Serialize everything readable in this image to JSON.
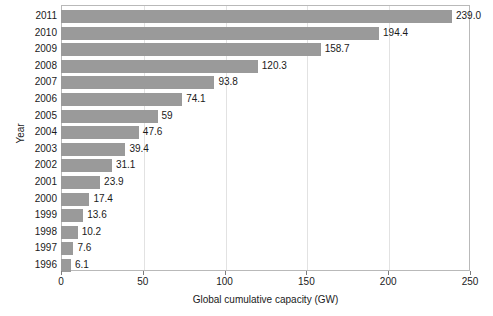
{
  "chart_data": {
    "type": "bar",
    "orientation": "horizontal",
    "title": "",
    "xlabel": "Global cumulative capacity (GW)",
    "ylabel": "Year",
    "categories": [
      "2011",
      "2010",
      "2009",
      "2008",
      "2007",
      "2006",
      "2005",
      "2004",
      "2003",
      "2002",
      "2001",
      "2000",
      "1999",
      "1998",
      "1997",
      "1996"
    ],
    "values": [
      239.0,
      194.4,
      158.7,
      120.3,
      93.8,
      74.1,
      59,
      47.6,
      39.4,
      31.1,
      23.9,
      17.4,
      13.6,
      10.2,
      7.6,
      6.1
    ],
    "data_labels": [
      "239.0",
      "194.4",
      "158.7",
      "120.3",
      "93.8",
      "74.1",
      "59",
      "47.6",
      "39.4",
      "31.1",
      "23.9",
      "17.4",
      "13.6",
      "10.2",
      "7.6",
      "6.1"
    ],
    "xlim": [
      0,
      250
    ],
    "xticks": [
      0,
      50,
      100,
      150,
      200,
      250
    ],
    "xtick_labels": [
      "0",
      "50",
      "100",
      "150",
      "200",
      "250"
    ],
    "grid": "vertical",
    "legend": "none",
    "bar_color": "#9a9a9a",
    "axis_color": "#b9b9b9",
    "gridline_color": "#e2e2e2",
    "background_color": "#ffffff"
  }
}
